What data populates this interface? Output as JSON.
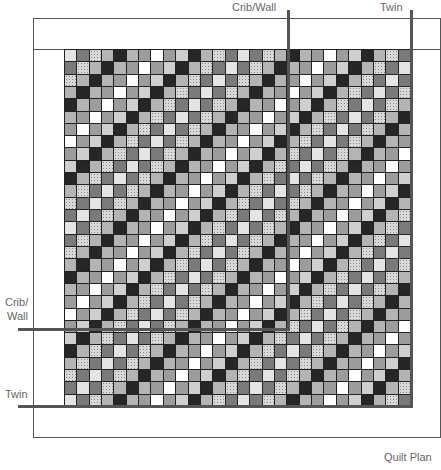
{
  "title": "Quilt Plan",
  "labels": {
    "crib_wall_top": "Crib/Wall",
    "twin_top": "Twin",
    "crib_wall_left_line1": "Crib/",
    "crib_wall_left_line2": "Wall",
    "twin_left": "Twin"
  },
  "grid": {
    "columns": 28,
    "rows": 29,
    "cell_size_px": 12.3,
    "pattern_rule": "cell(row,col) = sequence[(row + col) mod 14]",
    "sequence": [
      "VL",
      "DG",
      "CK",
      "LG",
      "BK",
      "LG",
      "G",
      "W",
      "G",
      "L",
      "BK",
      "LG",
      "CK",
      "DG"
    ]
  },
  "fabric_legend": {
    "VL": {
      "name": "very light gray",
      "color": "#e4e4e4"
    },
    "L": {
      "name": "light gray",
      "color": "#cfcfcf"
    },
    "LG": {
      "name": "medium light gray",
      "color": "#b4b4b4"
    },
    "G": {
      "name": "medium gray",
      "color": "#9c9c9c"
    },
    "DG": {
      "name": "dark gray",
      "color": "#7a7a7a"
    },
    "BK": {
      "name": "black",
      "color": "#262626"
    },
    "W": {
      "name": "white",
      "color": "#ffffff"
    },
    "CK": {
      "name": "checkered print",
      "color": "#d8d8d8"
    }
  },
  "size_markers": [
    {
      "name": "Crib/Wall",
      "vertical_x": 288,
      "horizontal_y": 329
    },
    {
      "name": "Twin",
      "vertical_x": 411,
      "horizontal_y": 406
    }
  ]
}
